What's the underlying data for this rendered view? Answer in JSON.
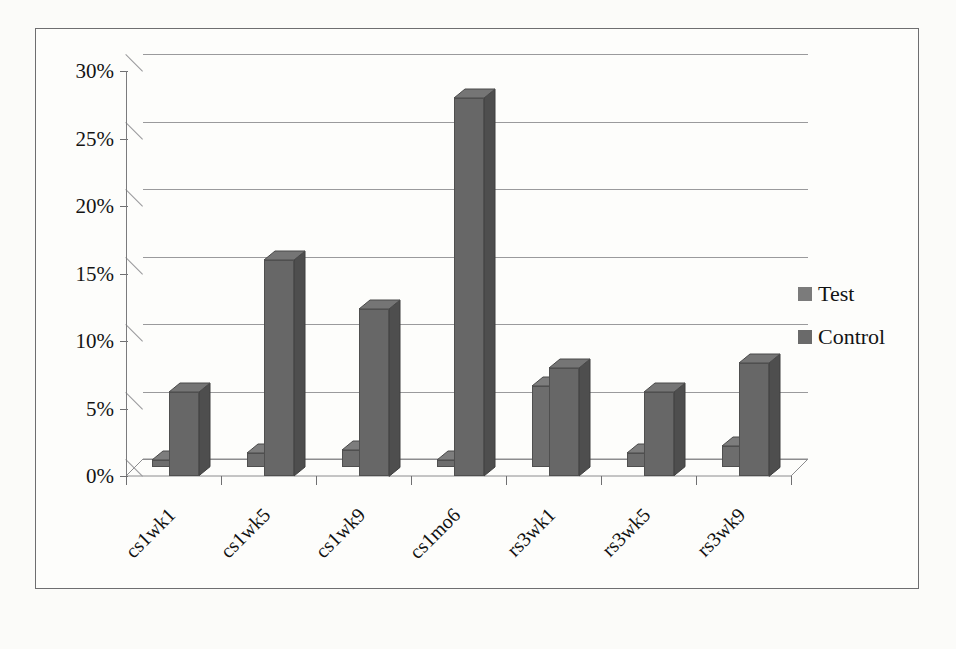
{
  "chart_data": {
    "type": "bar",
    "title": "",
    "subtitle": "",
    "xlabel": "",
    "ylabel": "",
    "categories": [
      "cs1wk1",
      "cs1wk5",
      "cs1wk9",
      "cs1mo6",
      "rs3wk1",
      "rs3wk5",
      "rs3wk9"
    ],
    "series": [
      {
        "name": "Test",
        "values": [
          0.5,
          1.0,
          1.2,
          0.5,
          6.0,
          1.0,
          1.5
        ],
        "color": "#6d6d6d"
      },
      {
        "name": "Control",
        "values": [
          6.2,
          16.0,
          12.4,
          28.0,
          8.0,
          6.2,
          8.4
        ],
        "color": "#676767"
      }
    ],
    "ylim": [
      0,
      30
    ],
    "yticks": [
      0,
      5,
      10,
      15,
      20,
      25,
      30
    ],
    "ytick_labels": [
      "0%",
      "5%",
      "10%",
      "15%",
      "20%",
      "25%",
      "30%"
    ],
    "grid": true,
    "legend_position": "right",
    "style": "3d-column",
    "value_unit": "%"
  },
  "legend": {
    "items": [
      {
        "label": "Test",
        "swatch_color": "#7b7b7b"
      },
      {
        "label": "Control",
        "swatch_color": "#6a6a6a"
      }
    ]
  },
  "colors": {
    "background": "#fbfbf9",
    "plot_background": "#fdfdfb",
    "border": "#6e6e70",
    "gridline": "#9a9a9c",
    "axis": "#7b7b7d",
    "text": "#141414"
  }
}
